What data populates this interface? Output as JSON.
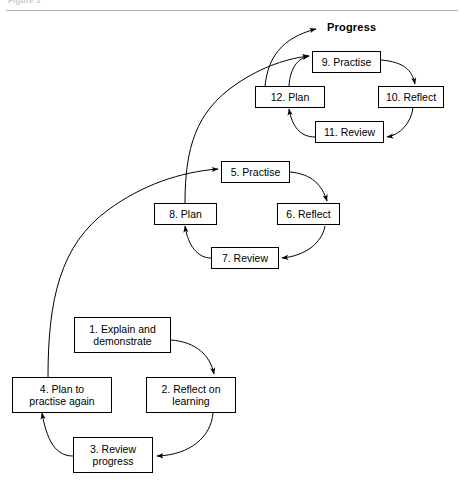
{
  "figure": {
    "caption": "Figure 1",
    "progress_label": "Progress",
    "accent_color": "#000000",
    "background_color": "#ffffff",
    "rule_color": "#b4b4b4"
  },
  "cycles": [
    {
      "name": "cycle-1-initial",
      "nodes": [
        {
          "id": "n1",
          "label": "1. Explain and\ndemonstrate",
          "x": 74,
          "y": 317,
          "w": 97,
          "h": 36
        },
        {
          "id": "n2",
          "label": "2. Reflect on\nlearning",
          "x": 146,
          "y": 377,
          "w": 90,
          "h": 36
        },
        {
          "id": "n3",
          "label": "3. Review\nprogress",
          "x": 73,
          "y": 437,
          "w": 80,
          "h": 36
        },
        {
          "id": "n4",
          "label": "4. Plan to\npractise again",
          "x": 12,
          "y": 377,
          "w": 100,
          "h": 36
        }
      ]
    },
    {
      "name": "cycle-2-middle",
      "nodes": [
        {
          "id": "n5",
          "label": "5. Practise",
          "x": 221,
          "y": 161,
          "w": 69,
          "h": 22
        },
        {
          "id": "n6",
          "label": "6. Reflect",
          "x": 277,
          "y": 203,
          "w": 63,
          "h": 22
        },
        {
          "id": "n7",
          "label": "7. Review",
          "x": 211,
          "y": 247,
          "w": 68,
          "h": 22
        },
        {
          "id": "n8",
          "label": "8. Plan",
          "x": 154,
          "y": 203,
          "w": 63,
          "h": 22
        }
      ]
    },
    {
      "name": "cycle-3-top",
      "nodes": [
        {
          "id": "n9",
          "label": "9. Practise",
          "x": 312,
          "y": 51,
          "w": 69,
          "h": 22
        },
        {
          "id": "n10",
          "label": "10. Reflect",
          "x": 378,
          "y": 86,
          "w": 66,
          "h": 22
        },
        {
          "id": "n11",
          "label": "11. Review",
          "x": 315,
          "y": 121,
          "w": 69,
          "h": 22
        },
        {
          "id": "n12",
          "label": "12. Plan",
          "x": 255,
          "y": 86,
          "w": 70,
          "h": 22
        }
      ]
    }
  ],
  "arrows": [
    {
      "name": "arrow-1-to-2",
      "path": "M 171,340 C 196,342 210,355 214,374",
      "arrowhead": true
    },
    {
      "name": "arrow-2-to-3",
      "path": "M 213,413 C 211,437 190,455 157,456",
      "arrowhead": true
    },
    {
      "name": "arrow-3-to-4",
      "path": "M 73,456 C 60,456 48,448 42,413",
      "arrowhead": true
    },
    {
      "name": "arrow-4-up-to-5",
      "path": "M 48,377 C 48,300 60,245 108,210 C 142,185 180,172 218,169",
      "arrowhead": true
    },
    {
      "name": "arrow-5-to-6",
      "path": "M 290,172 C 312,174 322,185 327,201",
      "arrowhead": true
    },
    {
      "name": "arrow-6-to-7",
      "path": "M 325,226 C 322,243 305,256 282,258",
      "arrowhead": true
    },
    {
      "name": "arrow-7-to-8",
      "path": "M 211,258 C 198,258 188,246 185,226",
      "arrowhead": true
    },
    {
      "name": "arrow-8-up-to-9",
      "path": "M 185,203 C 185,148 196,112 235,85 C 262,66 290,58 309,56",
      "arrowhead": true
    },
    {
      "name": "arrow-9-to-10",
      "path": "M 381,60 C 404,62 412,70 415,84",
      "arrowhead": true
    },
    {
      "name": "arrow-10-to-11",
      "path": "M 413,108 C 411,123 400,135 387,137",
      "arrowhead": true
    },
    {
      "name": "arrow-11-to-12",
      "path": "M 315,137 C 300,137 292,126 289,109",
      "arrowhead": true
    },
    {
      "name": "arrow-12-to-9",
      "path": "M 289,86 C 290,68 298,58 309,56",
      "arrowhead": true
    },
    {
      "name": "arrow-progress",
      "path": "M 265,86 C 268,58 281,38 316,29",
      "arrowhead": true
    }
  ]
}
